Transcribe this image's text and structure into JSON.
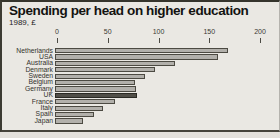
{
  "title": "Spending per head on higher education",
  "subtitle": "1989, £",
  "chart_data": {
    "type": "bar",
    "orientation": "horizontal",
    "title": "Spending per head on higher education",
    "subtitle": "1989, £",
    "categories": [
      "Netherlands",
      "USA",
      "Australia",
      "Denmark",
      "Sweden",
      "Belgium",
      "Germany",
      "UK",
      "France",
      "Italy",
      "Spain",
      "Japan"
    ],
    "values": [
      170,
      161,
      118,
      99,
      89,
      79,
      80,
      81,
      59,
      47,
      38,
      28
    ],
    "unit": "£ per head",
    "xlabel": "",
    "ylabel": "",
    "xlim": [
      0,
      200
    ],
    "x_ticks": [
      0,
      50,
      100,
      150,
      200
    ],
    "grid": "off",
    "legend": "none",
    "highlight_category": "UK",
    "colors": {
      "background": "#eae8e3",
      "bar_fill": "#b2b0ab",
      "bar_border": "#4c4a42",
      "highlight_fill": "#514f48",
      "frame_border": "#35342c",
      "text": "#131311"
    }
  }
}
